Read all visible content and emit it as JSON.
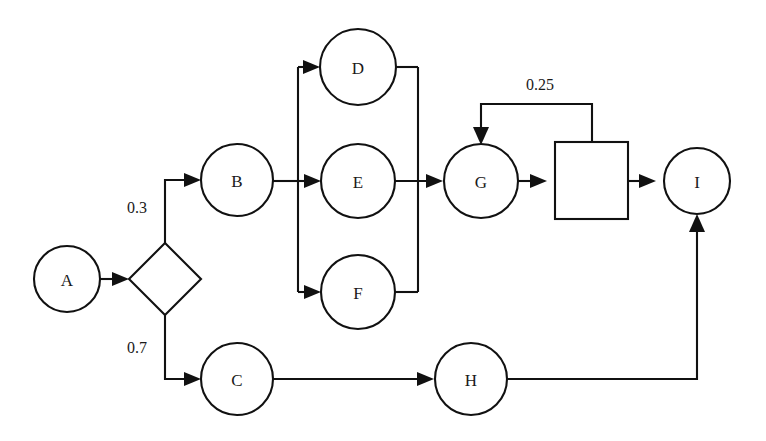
{
  "diagram": {
    "background_color": "#ffffff",
    "stroke_color": "#111111",
    "label_color": "#1a1a1a",
    "nodes": [
      {
        "id": "A",
        "label": "A",
        "shape": "circle",
        "cx": 67,
        "cy": 279,
        "r": 33
      },
      {
        "id": "DECISION",
        "label": "",
        "shape": "diamond",
        "cx": 165,
        "cy": 279,
        "half": 36
      },
      {
        "id": "B",
        "label": "B",
        "shape": "circle",
        "cx": 237,
        "cy": 180,
        "r": 36
      },
      {
        "id": "C",
        "label": "C",
        "shape": "circle",
        "cx": 237,
        "cy": 379,
        "r": 36
      },
      {
        "id": "D",
        "label": "D",
        "shape": "circle",
        "cx": 358,
        "cy": 67,
        "r": 38
      },
      {
        "id": "E",
        "label": "E",
        "shape": "circle",
        "cx": 358,
        "cy": 181,
        "r": 37
      },
      {
        "id": "F",
        "label": "F",
        "shape": "circle",
        "cx": 358,
        "cy": 292,
        "r": 37
      },
      {
        "id": "G",
        "label": "G",
        "shape": "circle",
        "cx": 481,
        "cy": 181,
        "r": 37
      },
      {
        "id": "BOX",
        "label": "",
        "shape": "square",
        "x": 555,
        "y": 142,
        "width": 73,
        "height": 77
      },
      {
        "id": "H",
        "label": "H",
        "shape": "circle",
        "cx": 471,
        "cy": 379,
        "r": 36
      },
      {
        "id": "I",
        "label": "I",
        "shape": "circle",
        "cx": 697,
        "cy": 181,
        "r": 33
      }
    ],
    "edge_labels": [
      {
        "id": "p-branch-b",
        "text": "0.3",
        "x": 137,
        "y": 207
      },
      {
        "id": "p-branch-c",
        "text": "0.7",
        "x": 137,
        "y": 347
      },
      {
        "id": "p-feedback",
        "text": "0.25",
        "x": 540,
        "y": 84
      }
    ],
    "edges": [
      {
        "id": "A-to-decision",
        "from": "A",
        "to": "DECISION"
      },
      {
        "id": "decision-to-B",
        "from": "DECISION",
        "to": "B",
        "label": "0.3"
      },
      {
        "id": "decision-to-C",
        "from": "DECISION",
        "to": "C",
        "label": "0.7"
      },
      {
        "id": "B-to-split",
        "from": "B",
        "to": "SPLIT"
      },
      {
        "id": "split-to-D",
        "from": "SPLIT",
        "to": "D"
      },
      {
        "id": "split-to-E",
        "from": "SPLIT",
        "to": "E"
      },
      {
        "id": "split-to-F",
        "from": "SPLIT",
        "to": "F"
      },
      {
        "id": "D-to-join",
        "from": "D",
        "to": "JOIN"
      },
      {
        "id": "E-to-join",
        "from": "E",
        "to": "JOIN"
      },
      {
        "id": "F-to-join",
        "from": "F",
        "to": "JOIN"
      },
      {
        "id": "join-to-G",
        "from": "JOIN",
        "to": "G"
      },
      {
        "id": "G-to-box",
        "from": "G",
        "to": "BOX"
      },
      {
        "id": "box-to-I",
        "from": "BOX",
        "to": "I"
      },
      {
        "id": "box-feedback-G",
        "from": "BOX",
        "to": "G",
        "label": "0.25"
      },
      {
        "id": "C-to-H",
        "from": "C",
        "to": "H"
      },
      {
        "id": "H-to-I",
        "from": "H",
        "to": "I"
      }
    ]
  }
}
